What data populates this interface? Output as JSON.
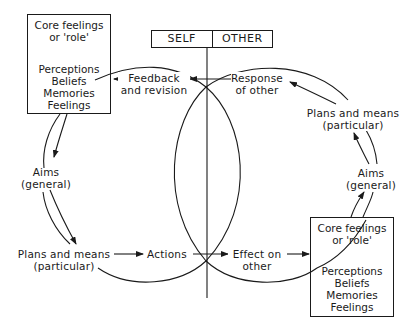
{
  "header": {
    "self_label": "SELF",
    "other_label": "OTHER"
  },
  "self_box": {
    "core": [
      "Core feelings",
      "or 'role'"
    ],
    "contents": [
      "Perceptions",
      "Beliefs",
      "Memories",
      "Feelings"
    ]
  },
  "other_box": {
    "core": [
      "Core feelings",
      "or 'role'"
    ],
    "contents": [
      "Perceptions",
      "Beliefs",
      "Memories",
      "Feelings"
    ]
  },
  "labels": {
    "feedback": [
      "Feedback",
      "and revision"
    ],
    "response": [
      "Response",
      "of other"
    ],
    "self_aims": [
      "Aims",
      "(general)"
    ],
    "self_plans": [
      "Plans and means",
      "(particular)"
    ],
    "actions": "Actions",
    "effect": [
      "Effect on",
      "other"
    ],
    "other_aims": [
      "Aims",
      "(general)"
    ],
    "other_plans": [
      "Plans and means",
      "(particular)"
    ]
  },
  "colors": {
    "ink": "#1a1a1a",
    "background": "#ffffff"
  }
}
